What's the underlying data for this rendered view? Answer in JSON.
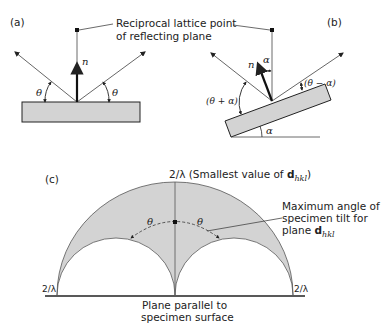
{
  "colors": {
    "ink": "#222222",
    "fill": "#d3d3d3",
    "line_light": "#666666"
  },
  "panel_a": {
    "label": "(a)",
    "normal_label": "n",
    "angle_left": "θ",
    "angle_right": "θ"
  },
  "panel_b": {
    "label": "(b)",
    "normal_label": "n",
    "alpha_top": "α",
    "angle_left": "(θ + α)",
    "angle_right": "(θ − α)",
    "alpha_bottom": "α"
  },
  "callout": {
    "line1": "Reciprocal lattice point",
    "line2": "of reflecting plane"
  },
  "panel_c": {
    "label": "(c)",
    "top_label_prefix": "2/λ (Smallest value of ",
    "top_label_bold": "d",
    "top_label_sub": "hkl",
    "top_label_suffix": ")",
    "left_label": "2/λ",
    "right_label": "2/λ",
    "theta_left": "θ",
    "theta_right": "θ",
    "max_tilt_line1": "Maximum angle of",
    "max_tilt_line2": "specimen tilt for",
    "max_tilt_line3_prefix": "plane ",
    "max_tilt_line3_bold": "d",
    "max_tilt_line3_sub": "hkl",
    "bottom_line1": "Plane parallel to",
    "bottom_line2": "specimen surface"
  }
}
